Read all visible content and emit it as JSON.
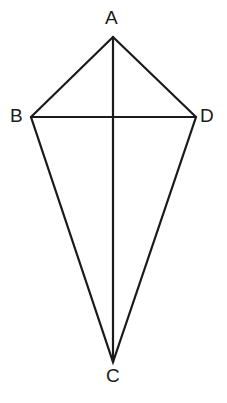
{
  "figure": {
    "name": "kite-abcd",
    "background_color": "#ffffff",
    "stroke_color": "#1a1a1a",
    "stroke_width": 2.2,
    "canvas": {
      "width": 227,
      "height": 403
    }
  },
  "vertices": [
    {
      "id": "A",
      "label": "A",
      "x": 113,
      "y": 37,
      "label_x": 105,
      "label_y": 8,
      "role": "top-apex"
    },
    {
      "id": "B",
      "label": "B",
      "x": 31,
      "y": 117,
      "label_x": 10,
      "label_y": 106,
      "role": "left-vertex"
    },
    {
      "id": "C",
      "label": "C",
      "x": 113,
      "y": 362,
      "label_x": 106,
      "label_y": 366,
      "role": "bottom-apex"
    },
    {
      "id": "D",
      "label": "D",
      "x": 196,
      "y": 117,
      "label_x": 200,
      "label_y": 106,
      "role": "right-vertex"
    }
  ],
  "edges": [
    {
      "id": "AB",
      "from": "A",
      "to": "B",
      "kind": "side"
    },
    {
      "id": "AD",
      "from": "A",
      "to": "D",
      "kind": "side"
    },
    {
      "id": "BC",
      "from": "B",
      "to": "C",
      "kind": "side"
    },
    {
      "id": "DC",
      "from": "D",
      "to": "C",
      "kind": "side"
    }
  ],
  "diagonals": [
    {
      "id": "AC",
      "from": "A",
      "to": "C",
      "kind": "diagonal",
      "orientation": "vertical"
    },
    {
      "id": "BD",
      "from": "B",
      "to": "D",
      "kind": "diagonal",
      "orientation": "horizontal"
    }
  ],
  "intersection": {
    "id": "P",
    "x": 113,
    "y": 117,
    "label": ""
  },
  "geometry_paths": {
    "outline": "M 113,37 L 31,117 L 113,362 L 196,117 Z",
    "diagonal_vertical": "M 113,37 L 113,362",
    "diagonal_horizontal": "M 31,117 L 196,117"
  }
}
